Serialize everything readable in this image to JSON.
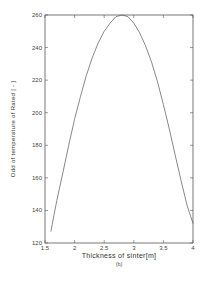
{
  "chart_data": {
    "type": "line",
    "title": "",
    "xlabel": "Thickness of sinter[m]",
    "ylabel": "Odd of temperature of Rated [ - ]",
    "caption": "(b)",
    "xlim": [
      1.5,
      4
    ],
    "ylim": [
      120,
      260
    ],
    "xticks": [
      1.5,
      2,
      2.5,
      3,
      3.5,
      4
    ],
    "xtick_labels": [
      "1.5",
      "2",
      "2.5",
      "3",
      "3.5",
      "4"
    ],
    "yticks": [
      120,
      140,
      160,
      180,
      200,
      220,
      240,
      260
    ],
    "ytick_labels": [
      "120",
      "140",
      "160",
      "180",
      "200",
      "220",
      "240",
      "260"
    ],
    "grid": false,
    "legend": null,
    "series": [
      {
        "name": "curve",
        "color": "#555555",
        "x": [
          1.6,
          1.65,
          1.7,
          1.8,
          1.9,
          2.0,
          2.1,
          2.2,
          2.3,
          2.4,
          2.5,
          2.6,
          2.7,
          2.8,
          2.9,
          3.0,
          3.1,
          3.2,
          3.3,
          3.4,
          3.5,
          3.6,
          3.7,
          3.8,
          3.9,
          4.0
        ],
        "y": [
          127,
          137,
          146,
          163,
          180,
          196,
          210,
          223,
          234,
          243,
          250,
          255,
          259,
          260,
          259,
          255,
          249,
          241,
          231,
          219,
          205,
          190,
          174,
          158,
          143,
          132
        ]
      }
    ]
  }
}
